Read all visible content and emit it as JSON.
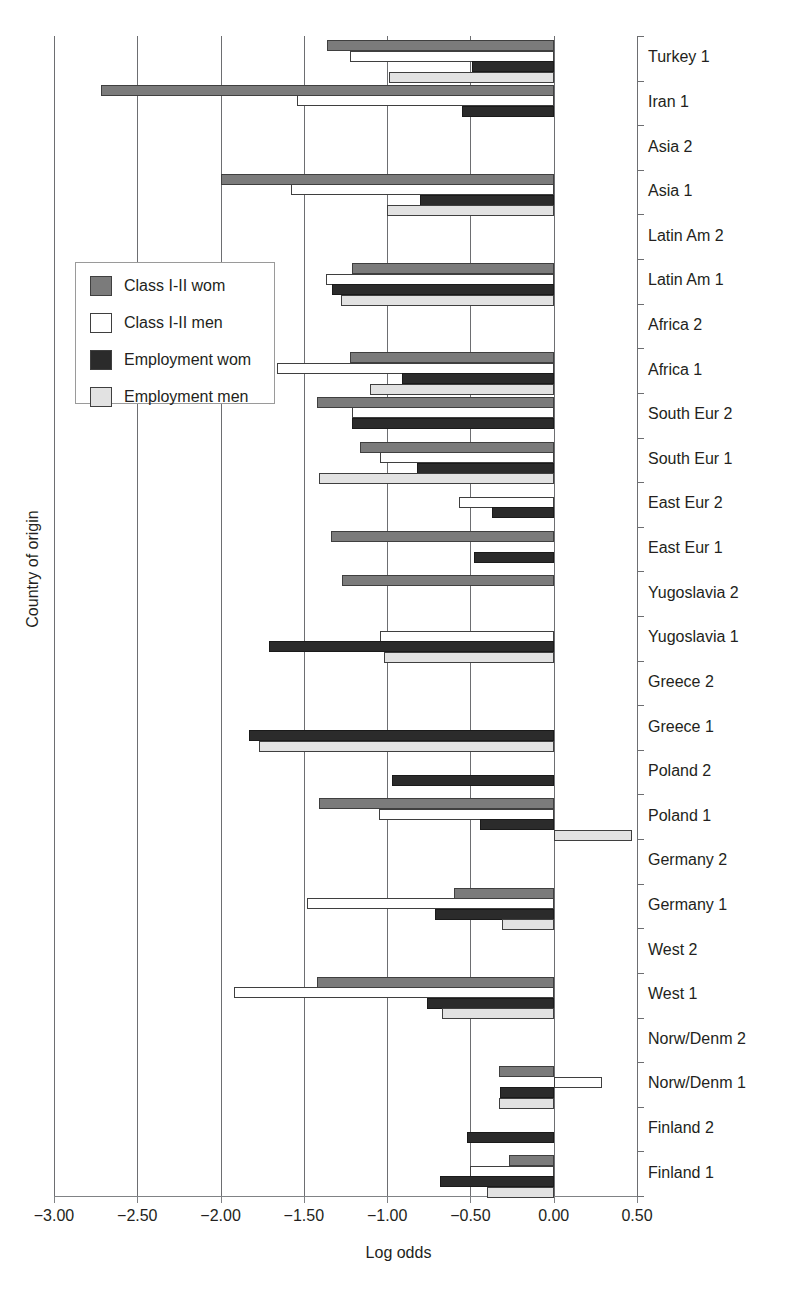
{
  "chart_data": {
    "type": "bar",
    "orientation": "horizontal",
    "title": "",
    "xlabel": "Log odds",
    "ylabel": "Country of origin",
    "xlim": [
      -3.0,
      0.5
    ],
    "xticks": [
      "-3.00",
      "-2.50",
      "-2.00",
      "-1.50",
      "-1.00",
      "-0.50",
      "0.00",
      "0.50"
    ],
    "xtick_values": [
      -3.0,
      -2.5,
      -2.0,
      -1.5,
      -1.0,
      -0.5,
      0.0,
      0.5
    ],
    "grid": "vertical",
    "legend_position": "middle-left",
    "series_names": [
      "Class I-II wom",
      "Class I-II men",
      "Employment wom",
      "Employment men"
    ],
    "series_colors": [
      "#7b7b7b",
      "#ffffff",
      "#2b2b2b",
      "#e2e2e2"
    ],
    "categories": [
      "Turkey 1",
      "Iran 1",
      "Asia 2",
      "Asia 1",
      "Latin Am 2",
      "Latin Am 1",
      "Africa 2",
      "Africa 1",
      "South Eur 2",
      "South Eur 1",
      "East Eur 2",
      "East Eur 1",
      "Yugoslavia 2",
      "Yugoslavia 1",
      "Greece 2",
      "Greece 1",
      "Poland 2",
      "Poland 1",
      "Germany 2",
      "Germany 1",
      "West 2",
      "West 1",
      "Norw/Denm 2",
      "Norw/Denm 1",
      "Finland 2",
      "Finland 1"
    ],
    "series": [
      {
        "name": "Class I-II wom",
        "values": [
          -1.36,
          -2.72,
          0,
          -2.0,
          0,
          -1.21,
          0,
          -1.22,
          -1.42,
          -1.16,
          0,
          -1.34,
          -1.27,
          0,
          0,
          0,
          0,
          -1.41,
          0,
          -0.6,
          0,
          -1.42,
          0,
          -0.33,
          0,
          -0.27
        ]
      },
      {
        "name": "Class I-II men",
        "values": [
          -1.22,
          -1.54,
          0,
          -1.58,
          0,
          -1.37,
          0,
          -1.66,
          -1.21,
          -1.04,
          -0.57,
          0,
          0,
          -1.04,
          0,
          0,
          0,
          -1.05,
          0,
          -1.48,
          0,
          -1.92,
          0,
          0.29,
          0,
          -0.5
        ]
      },
      {
        "name": "Employment wom",
        "values": [
          -0.49,
          -0.55,
          0,
          -0.8,
          0,
          -1.33,
          0,
          -0.91,
          -1.21,
          -0.82,
          -0.37,
          -0.48,
          0,
          -1.71,
          0,
          -1.83,
          -0.97,
          -0.44,
          0,
          -0.71,
          0,
          -0.76,
          0,
          -0.32,
          -0.52,
          -0.68
        ]
      },
      {
        "name": "Employment men",
        "values": [
          -0.99,
          0,
          0,
          -1.0,
          0,
          -1.28,
          0,
          -1.1,
          0,
          -1.41,
          0,
          0,
          0,
          -1.02,
          0,
          -1.77,
          0,
          0.47,
          0,
          -0.31,
          0,
          -0.67,
          0,
          -0.33,
          0,
          -0.4
        ]
      }
    ]
  },
  "legend": {
    "items": [
      {
        "label": "Class I-II wom",
        "swatch": "swatch-class-wom"
      },
      {
        "label": "Class I-II men",
        "swatch": "swatch-class-men"
      },
      {
        "label": "Employment wom",
        "swatch": "swatch-emp-wom"
      },
      {
        "label": "Employment men",
        "swatch": "swatch-emp-men"
      }
    ]
  }
}
